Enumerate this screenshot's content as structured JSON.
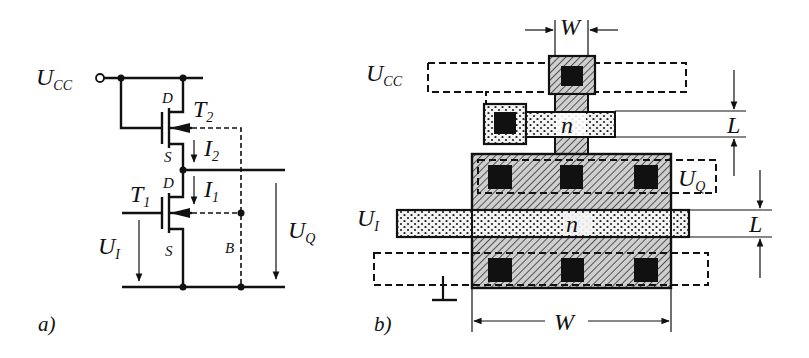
{
  "figure_a": {
    "caption": "a)",
    "labels": {
      "ucc_main": "U",
      "ucc_sub": "CC",
      "t2_main": "T",
      "t2_sub": "2",
      "t1_main": "T",
      "t1_sub": "1",
      "d2": "D",
      "s2": "S",
      "d1": "D",
      "s1": "S",
      "i2_main": "I",
      "i2_sub": "2",
      "i1_main": "I",
      "i1_sub": "1",
      "ui_main": "U",
      "ui_sub": "I",
      "uq_main": "U",
      "uq_sub": "Q",
      "bulk": "B"
    }
  },
  "figure_b": {
    "caption": "b)",
    "labels": {
      "ucc_main": "U",
      "ucc_sub": "CC",
      "uq_main": "U",
      "uq_sub": "Q",
      "ui_main": "U",
      "ui_sub": "I",
      "w_top": "W",
      "w_bottom": "W",
      "l_top": "L",
      "l_bottom": "L",
      "n_top": "n",
      "n_bottom": "n"
    }
  },
  "colors": {
    "ink": "#111111",
    "background": "#ffffff",
    "hatch_fill": "#bdbdbd"
  }
}
